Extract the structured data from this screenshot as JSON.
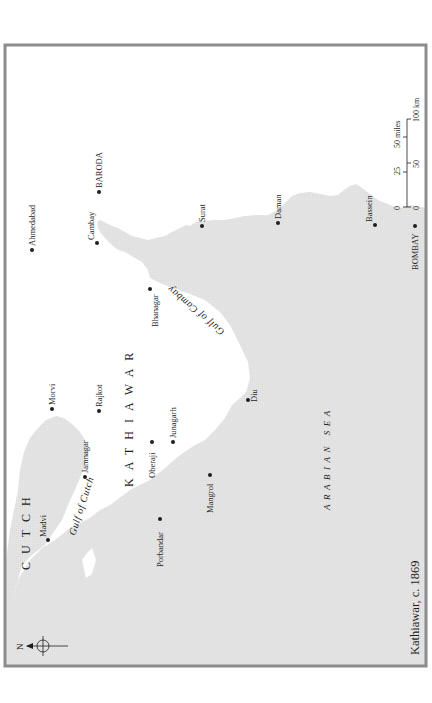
{
  "map": {
    "title": "Kathiawar, c. 1869",
    "orientation": "rotated 90° counter-clockwise (north points left)",
    "colors": {
      "land": "#ffffff",
      "sea": "#e3e3e3",
      "frame": "#8c8c8c",
      "ink": "#1e1e1e"
    },
    "compass": {
      "label": "N"
    },
    "regions": [
      {
        "name": "CUTCH"
      },
      {
        "name": "KATHIAWAR"
      }
    ],
    "water_bodies": [
      {
        "name": "ARABIAN SEA"
      },
      {
        "name": "Gulf of Cutch"
      },
      {
        "name": "Gulf of Cambay"
      }
    ],
    "places": [
      {
        "name": "Ahmedabad"
      },
      {
        "name": "BARODA"
      },
      {
        "name": "Cambay"
      },
      {
        "name": "Surat"
      },
      {
        "name": "Daman"
      },
      {
        "name": "Bassein"
      },
      {
        "name": "BOMBAY"
      },
      {
        "name": "Bhanagar"
      },
      {
        "name": "Morvi"
      },
      {
        "name": "Rajkot"
      },
      {
        "name": "Jamnagar"
      },
      {
        "name": "Junagarh"
      },
      {
        "name": "Oberaji"
      },
      {
        "name": "Mangrol"
      },
      {
        "name": "Porbandar"
      },
      {
        "name": "Madvi"
      },
      {
        "name": "Diu"
      }
    ],
    "scale_bar": {
      "miles_ticks": [
        "0",
        "25",
        "50 miles"
      ],
      "km_ticks": [
        "0",
        "50",
        "100 km"
      ]
    }
  }
}
